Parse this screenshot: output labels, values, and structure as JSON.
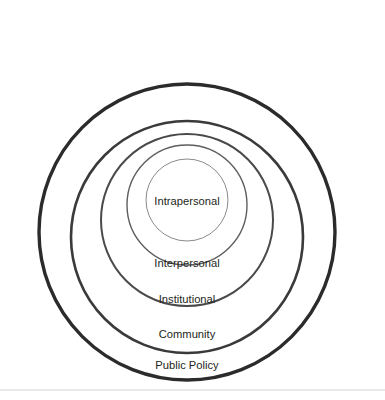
{
  "diagram": {
    "type": "concentric-circles",
    "background_color": "#ffffff",
    "text_color": "#231f20",
    "footer_rule_color": "#d2d2d2",
    "center_x": 187,
    "rings": [
      {
        "label": "Public Policy",
        "level": 5,
        "radius": 148,
        "center_y": 232,
        "stroke_color": "#2b2b2b",
        "stroke_width": 3.4,
        "label_x": 187,
        "label_y": 366
      },
      {
        "label": "Community",
        "level": 4,
        "radius": 116,
        "center_y": 237,
        "stroke_color": "#3a3a3a",
        "stroke_width": 2.6,
        "label_x": 187,
        "label_y": 335
      },
      {
        "label": "Institutional",
        "level": 3,
        "radius": 86,
        "center_y": 220,
        "stroke_color": "#4a4a4a",
        "stroke_width": 2.0,
        "label_x": 187,
        "label_y": 300
      },
      {
        "label": "Interpersonal",
        "level": 2,
        "radius": 60,
        "center_y": 205,
        "stroke_color": "#5e5e5e",
        "stroke_width": 1.4,
        "label_x": 187,
        "label_y": 264
      },
      {
        "label": "Intrapersonal",
        "level": 1,
        "radius": 41,
        "center_y": 200,
        "stroke_color": "#8a8a8a",
        "stroke_width": 1.0,
        "label_x": 187,
        "label_y": 202
      }
    ],
    "footer_rule": {
      "x1": 0,
      "x2": 385,
      "y": 390
    }
  }
}
